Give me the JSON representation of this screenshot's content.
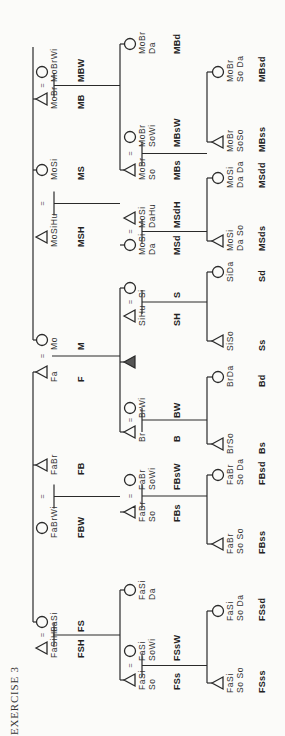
{
  "title": "EXERCISE 3",
  "orientation": "rotated-90-ccw",
  "generations": {
    "parents": [
      {
        "id": "FSH",
        "sex": "male",
        "labels": [
          "FaSiHu"
        ],
        "abbr": "FSH"
      },
      {
        "id": "FS",
        "sex": "female",
        "labels": [
          "FaSi"
        ],
        "abbr": "FS"
      },
      {
        "id": "FBW",
        "sex": "female",
        "labels": [
          "FaBrWi"
        ],
        "abbr": "FBW"
      },
      {
        "id": "FB",
        "sex": "male",
        "labels": [
          "FaBr"
        ],
        "abbr": "FB"
      },
      {
        "id": "F",
        "sex": "male",
        "labels": [
          "Fa"
        ],
        "abbr": "F"
      },
      {
        "id": "M",
        "sex": "female",
        "labels": [
          "Mo"
        ],
        "abbr": "M"
      },
      {
        "id": "MSH",
        "sex": "male",
        "labels": [
          "MoSiHu"
        ],
        "abbr": "MSH"
      },
      {
        "id": "MS",
        "sex": "female",
        "labels": [
          "MoSi"
        ],
        "abbr": "MS"
      },
      {
        "id": "MB",
        "sex": "male",
        "labels": [
          "MoBr"
        ],
        "abbr": "MB"
      },
      {
        "id": "MBW",
        "sex": "female",
        "labels": [
          "MoBrWi"
        ],
        "abbr": "MBW"
      }
    ],
    "ego_generation": [
      {
        "id": "FSs",
        "sex": "male",
        "labels": [
          "FaSi",
          "So"
        ],
        "abbr": "FSs"
      },
      {
        "id": "FSsW",
        "sex": "female",
        "labels": [
          "FaSi",
          "SoWi"
        ],
        "abbr": "FSsW"
      },
      {
        "id": "FSd",
        "sex": "female",
        "labels": [
          "FaSi",
          "Da"
        ],
        "abbr": ""
      },
      {
        "id": "FBs",
        "sex": "male",
        "labels": [
          "FaBr",
          "So"
        ],
        "abbr": "FBs"
      },
      {
        "id": "FBsW",
        "sex": "female",
        "labels": [
          "FaBr",
          "SoWi"
        ],
        "abbr": "FBsW"
      },
      {
        "id": "B",
        "sex": "male",
        "labels": [
          "Br"
        ],
        "abbr": "B"
      },
      {
        "id": "BW",
        "sex": "female",
        "labels": [
          "BrWi"
        ],
        "abbr": "BW"
      },
      {
        "id": "Ego",
        "sex": "ego",
        "labels": [],
        "abbr": ""
      },
      {
        "id": "SH",
        "sex": "male",
        "labels": [
          "SiHu"
        ],
        "abbr": "SH"
      },
      {
        "id": "S",
        "sex": "female",
        "labels": [
          "Si"
        ],
        "abbr": "S"
      },
      {
        "id": "MSd",
        "sex": "female",
        "labels": [
          "MoSi",
          "Da"
        ],
        "abbr": "MSd"
      },
      {
        "id": "MSdH",
        "sex": "male",
        "labels": [
          "MoSi",
          "DaHu"
        ],
        "abbr": "MSdH"
      },
      {
        "id": "MBs",
        "sex": "male",
        "labels": [
          "MoBr",
          "So"
        ],
        "abbr": "MBs"
      },
      {
        "id": "MBsW",
        "sex": "female",
        "labels": [
          "MoBr",
          "SoWi"
        ],
        "abbr": "MBsW"
      },
      {
        "id": "MBd",
        "sex": "female",
        "labels": [
          "MoBr",
          "Da"
        ],
        "abbr": "MBd"
      }
    ],
    "children": [
      {
        "id": "FSss",
        "sex": "male",
        "labels": [
          "FaSi",
          "So So"
        ],
        "abbr": "FSss"
      },
      {
        "id": "FSsd",
        "sex": "female",
        "labels": [
          "FaSi",
          "So Da"
        ],
        "abbr": "FSsd"
      },
      {
        "id": "FBss",
        "sex": "male",
        "labels": [
          "FaBr",
          "So So"
        ],
        "abbr": "FBss"
      },
      {
        "id": "FBsd",
        "sex": "female",
        "labels": [
          "FaBr",
          "So Da"
        ],
        "abbr": "FBsd"
      },
      {
        "id": "Bs",
        "sex": "male",
        "labels": [
          "BrSo"
        ],
        "abbr": "Bs"
      },
      {
        "id": "Bd",
        "sex": "female",
        "labels": [
          "BrDa"
        ],
        "abbr": "Bd"
      },
      {
        "id": "Ss",
        "sex": "male",
        "labels": [
          "SiSo"
        ],
        "abbr": "Ss"
      },
      {
        "id": "Sd",
        "sex": "female",
        "labels": [
          "SiDa"
        ],
        "abbr": "Sd"
      },
      {
        "id": "MSds",
        "sex": "male",
        "labels": [
          "MoSi",
          "Da So"
        ],
        "abbr": "MSds"
      },
      {
        "id": "MSdd",
        "sex": "female",
        "labels": [
          "MoSi",
          "Da Da"
        ],
        "abbr": "MSdd"
      },
      {
        "id": "MBss",
        "sex": "male",
        "labels": [
          "MoBr",
          "SoSo"
        ],
        "abbr": "MBss"
      },
      {
        "id": "MBsd",
        "sex": "female",
        "labels": [
          "MoBr",
          "So Da"
        ],
        "abbr": "MBsd"
      }
    ]
  },
  "marriage_symbol": "="
}
